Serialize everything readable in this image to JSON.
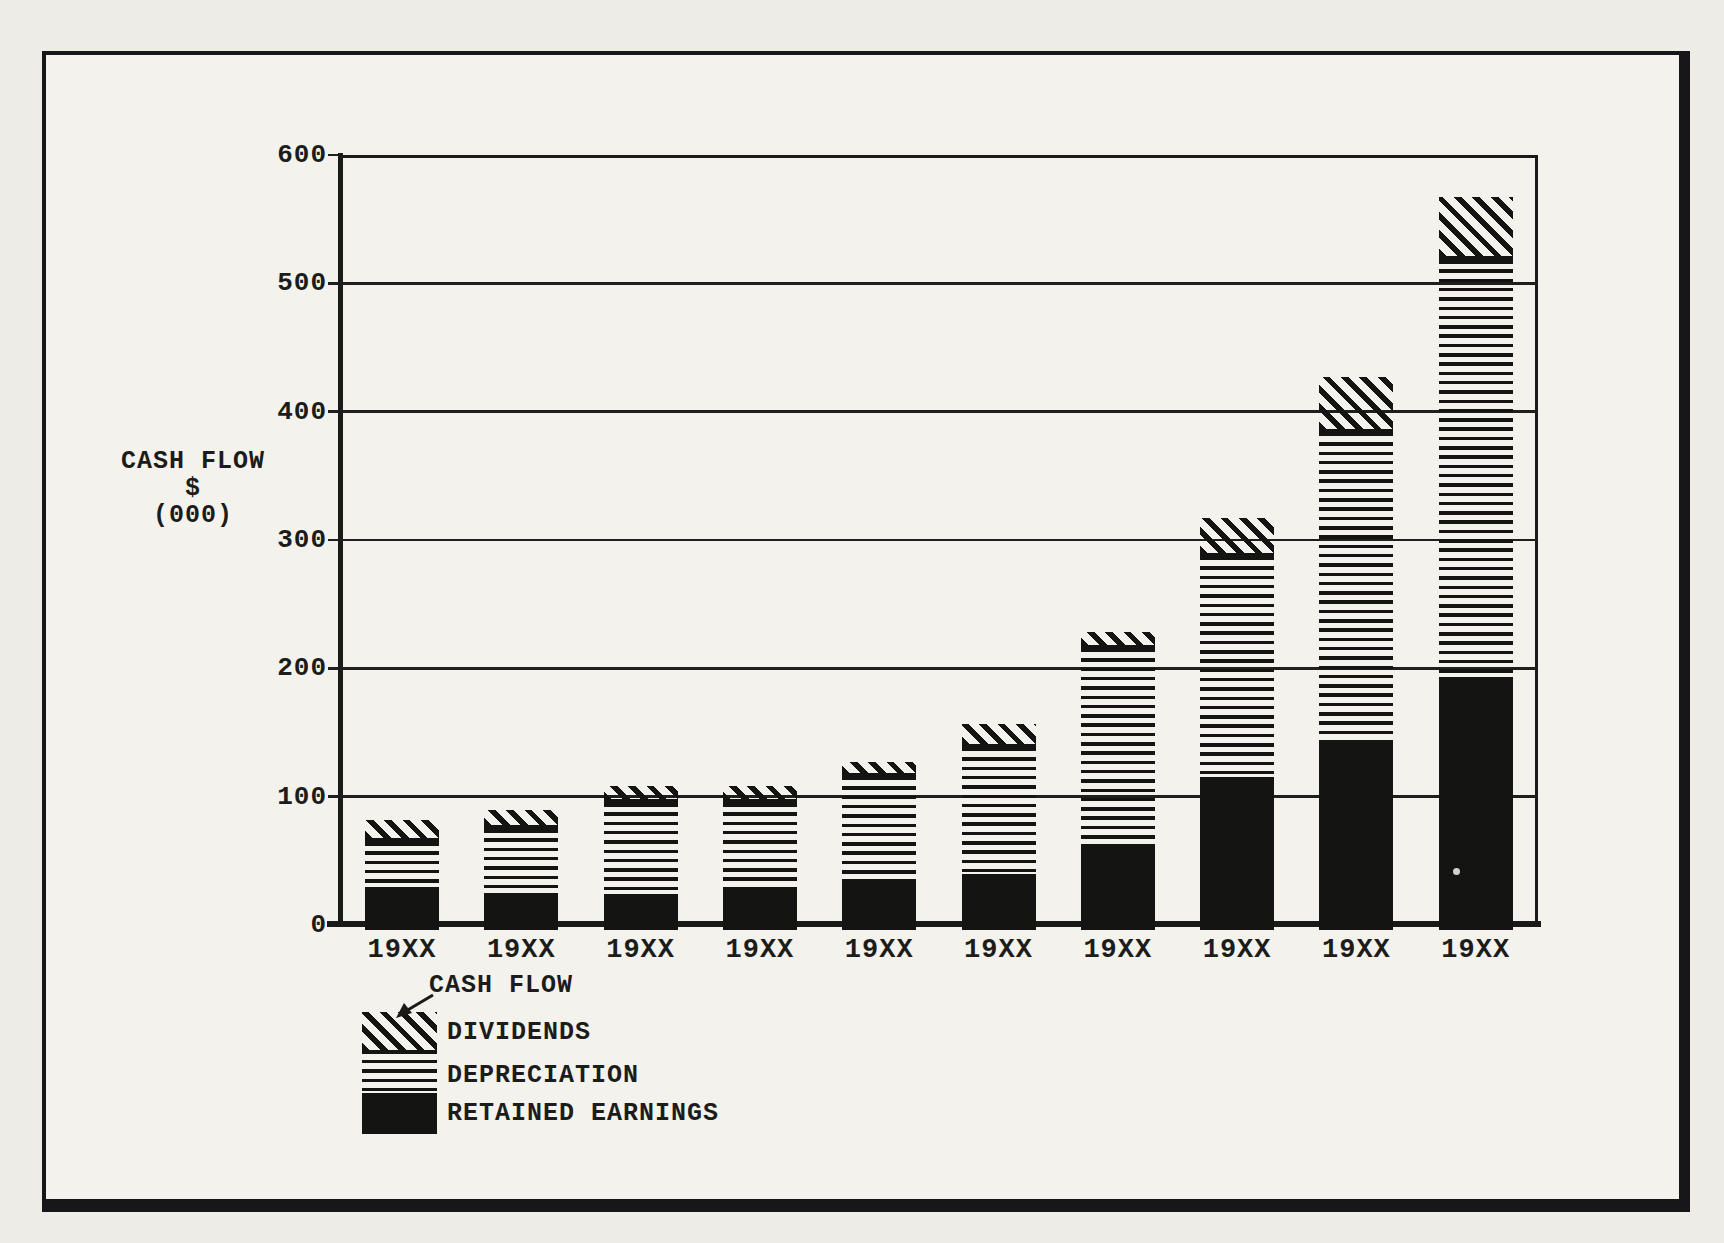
{
  "colors": {
    "ink": "#1c1c1a",
    "paper": "#f4f2ec",
    "paper_outer": "#eeece6"
  },
  "y_axis": {
    "title_lines": [
      "CASH FLOW",
      "$",
      "(000)"
    ]
  },
  "legend": {
    "pointer_label": "CASH FLOW",
    "entries": [
      {
        "label": "DIVIDENDS",
        "pattern": "diagonal"
      },
      {
        "label": "DEPRECIATION",
        "pattern": "hstripes"
      },
      {
        "label": "RETAINED EARNINGS",
        "pattern": "solid"
      }
    ]
  },
  "chart_data": {
    "type": "bar",
    "stacked": true,
    "title": "",
    "ylabel": "CASH FLOW $ (000)",
    "xlabel": "",
    "ylim": [
      0,
      600
    ],
    "yticks": [
      0,
      100,
      200,
      300,
      400,
      500,
      600
    ],
    "grid": true,
    "legend_position": "bottom-left",
    "categories": [
      "19XX",
      "19XX",
      "19XX",
      "19XX",
      "19XX",
      "19XX",
      "19XX",
      "19XX",
      "19XX",
      "19XX"
    ],
    "series": [
      {
        "name": "RETAINED EARNINGS",
        "pattern": "solid",
        "values": [
          30,
          25,
          24,
          29,
          35,
          40,
          61,
          115,
          143,
          193
        ]
      },
      {
        "name": "DEPRECIATION",
        "pattern": "hstripes",
        "values": [
          35,
          50,
          71,
          66,
          80,
          98,
          154,
          172,
          240,
          325
        ]
      },
      {
        "name": "DIVIDENDS",
        "pattern": "diagonal",
        "values": [
          17,
          15,
          13,
          13,
          12,
          19,
          13,
          30,
          44,
          49
        ]
      }
    ],
    "stack_totals": [
      82,
      90,
      108,
      108,
      127,
      157,
      228,
      317,
      427,
      567
    ]
  }
}
